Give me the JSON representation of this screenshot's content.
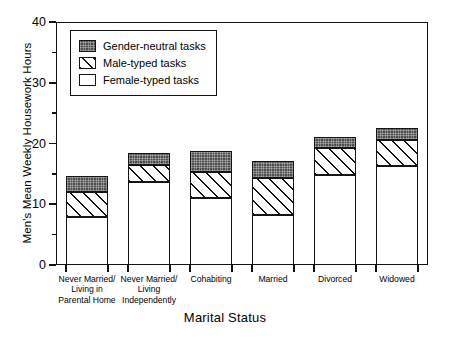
{
  "chart_data": {
    "type": "bar",
    "subtype": "stacked-bar",
    "title": "",
    "xlabel": "Marital Status",
    "ylabel": "Men's Mean Weekly Housework Hours",
    "ylim": [
      0,
      40
    ],
    "ytick_major": [
      0,
      10,
      20,
      30,
      40
    ],
    "ytick_minor": [
      5,
      15,
      25,
      35
    ],
    "ytick_labels": [
      "0",
      "10",
      "20",
      "30",
      "40"
    ],
    "grid": false,
    "legend_position": "upper-left-inside",
    "categories": [
      "Never Married/\nLiving in\nParental Home",
      "Never Married/\nLiving\nIndependently",
      "Cohabiting",
      "Married",
      "Divorced",
      "Widowed"
    ],
    "series": [
      {
        "name": "Female-typed tasks",
        "fill": "white",
        "values": [
          7.9,
          13.7,
          11.0,
          8.2,
          14.8,
          16.3
        ]
      },
      {
        "name": "Male-typed tasks",
        "fill": "diagonal-hatch",
        "values": [
          4.1,
          2.8,
          4.3,
          6.1,
          4.5,
          4.3
        ]
      },
      {
        "name": "Gender-neutral tasks",
        "fill": "dark-stipple",
        "values": [
          2.6,
          2.0,
          3.5,
          2.8,
          1.8,
          2.0
        ]
      }
    ],
    "totals": [
      14.6,
      18.5,
      18.8,
      17.1,
      21.1,
      22.6
    ],
    "stack_order_bottom_to_top": [
      "Female-typed tasks",
      "Male-typed tasks",
      "Gender-neutral tasks"
    ]
  },
  "legend": {
    "entries": [
      {
        "label": "Gender-neutral tasks",
        "swatch": "dark-stipple"
      },
      {
        "label": "Male-typed tasks",
        "swatch": "diagonal-hatch"
      },
      {
        "label": "Female-typed tasks",
        "swatch": "white"
      }
    ]
  },
  "colors": {
    "axis": "#111111",
    "outline": "#141414",
    "gender_neutral": "#4d4d4d",
    "male_typed": "#ffffff",
    "female_typed": "#ffffff",
    "background": "#ffffff"
  }
}
